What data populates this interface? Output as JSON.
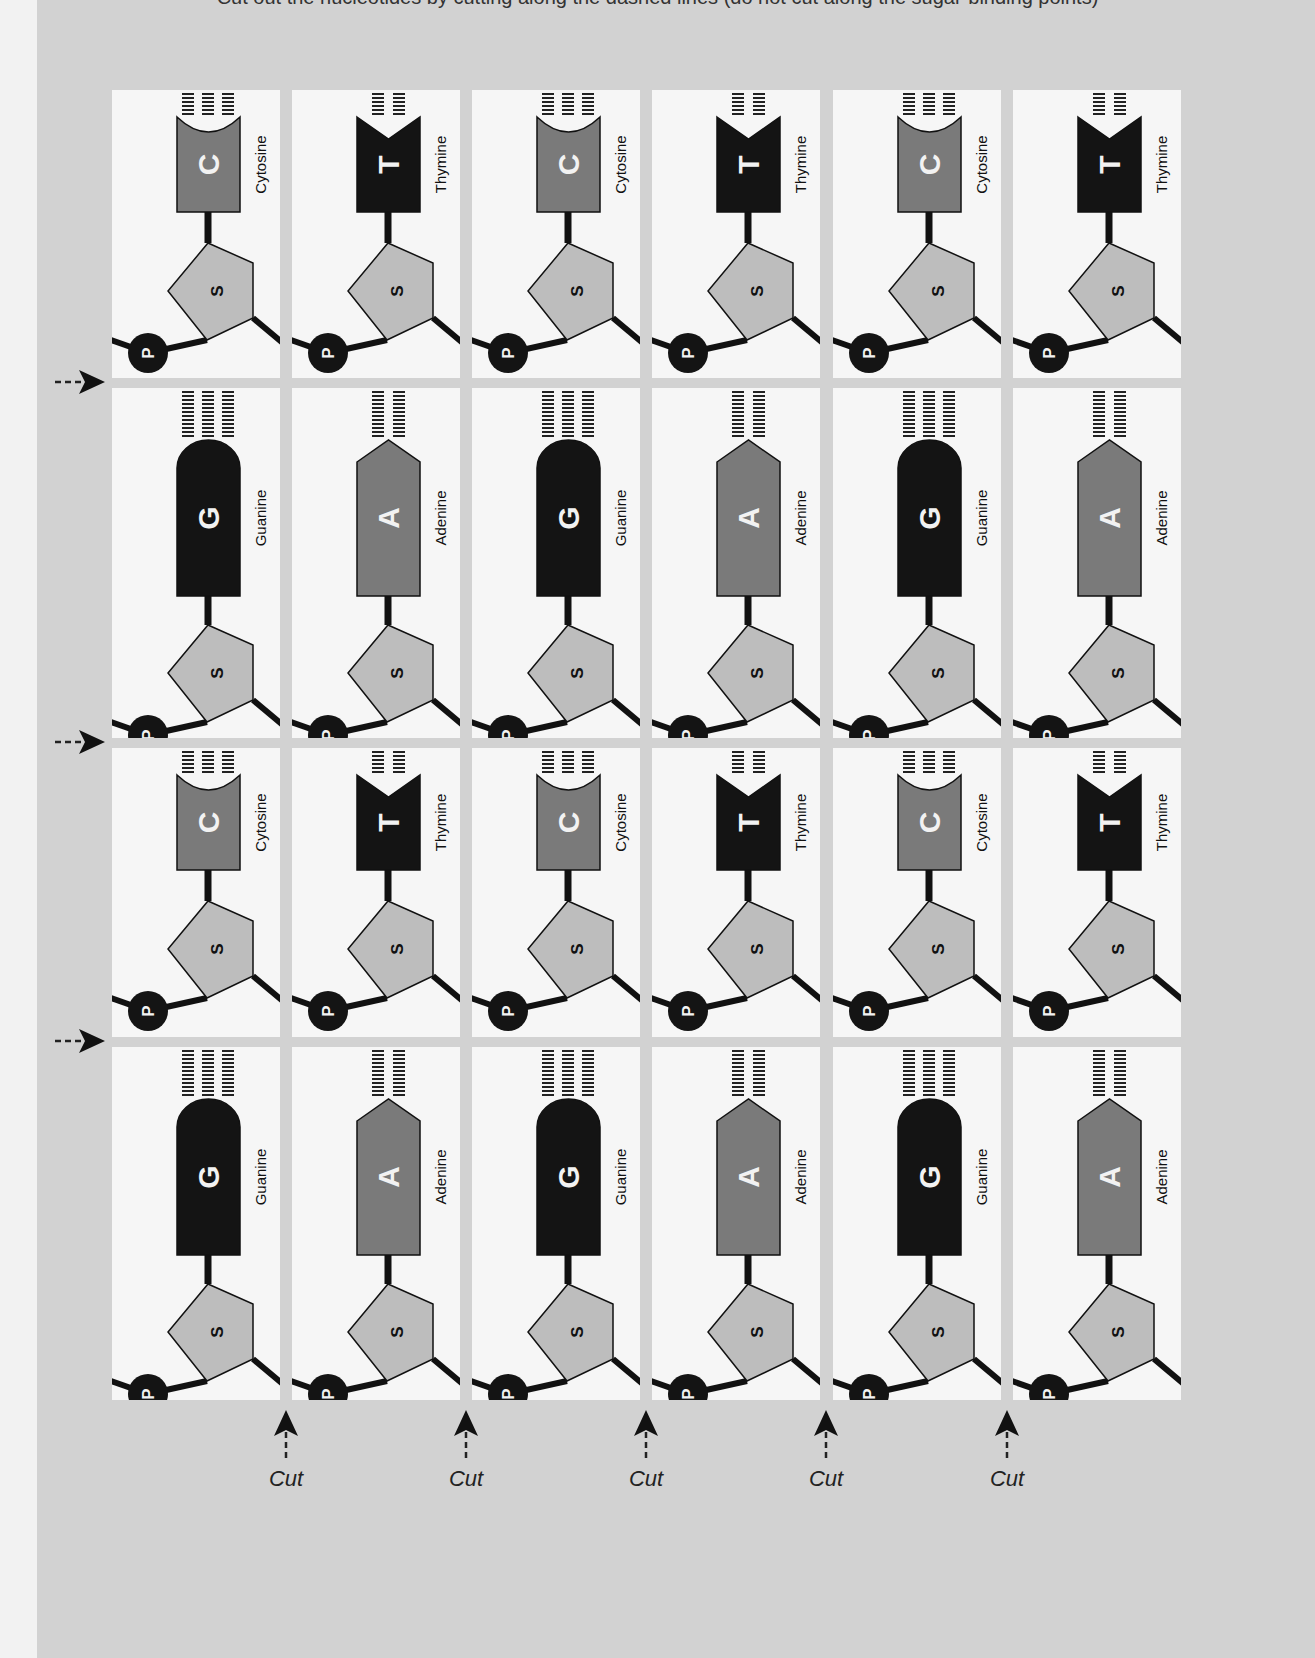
{
  "caption": "Cut out the nucleotides by cutting along the dashed lines (do not cut along the sugar-binding points)",
  "colors": {
    "page_bg": "#d2d2d2",
    "cell_bg": "#f6f6f6",
    "dark_base": "#141414",
    "mid_base": "#7a7a7a",
    "sugar": "#bdbdbd",
    "phosphate": "#141414",
    "outline": "#111111"
  },
  "labels": {
    "phosphate": "P",
    "sugar": "S",
    "cut": "Cut"
  },
  "columns_x": [
    112,
    292,
    472,
    652,
    833,
    1013
  ],
  "column_width": 168,
  "rows": [
    {
      "top": 90,
      "height": 288,
      "type": "pyrimidine",
      "cells": [
        {
          "letter": "C",
          "name": "Cytosine"
        },
        {
          "letter": "T",
          "name": "Thymine"
        },
        {
          "letter": "C",
          "name": "Cytosine"
        },
        {
          "letter": "T",
          "name": "Thymine"
        },
        {
          "letter": "C",
          "name": "Cytosine"
        },
        {
          "letter": "T",
          "name": "Thymine"
        }
      ]
    },
    {
      "top": 388,
      "height": 350,
      "type": "purine",
      "cells": [
        {
          "letter": "G",
          "name": "Guanine"
        },
        {
          "letter": "A",
          "name": "Adenine"
        },
        {
          "letter": "G",
          "name": "Guanine"
        },
        {
          "letter": "A",
          "name": "Adenine"
        },
        {
          "letter": "G",
          "name": "Guanine"
        },
        {
          "letter": "A",
          "name": "Adenine"
        }
      ]
    },
    {
      "top": 748,
      "height": 289,
      "type": "pyrimidine",
      "cells": [
        {
          "letter": "C",
          "name": "Cytosine"
        },
        {
          "letter": "T",
          "name": "Thymine"
        },
        {
          "letter": "C",
          "name": "Cytosine"
        },
        {
          "letter": "T",
          "name": "Thymine"
        },
        {
          "letter": "C",
          "name": "Cytosine"
        },
        {
          "letter": "T",
          "name": "Thymine"
        }
      ]
    },
    {
      "top": 1047,
      "height": 353,
      "type": "purine",
      "cells": [
        {
          "letter": "G",
          "name": "Guanine"
        },
        {
          "letter": "A",
          "name": "Adenine"
        },
        {
          "letter": "G",
          "name": "Guanine"
        },
        {
          "letter": "A",
          "name": "Adenine"
        },
        {
          "letter": "G",
          "name": "Guanine"
        },
        {
          "letter": "A",
          "name": "Adenine"
        }
      ]
    }
  ],
  "row_arrows_y": [
    382,
    742,
    1041
  ],
  "cut_markers_x": [
    286,
    466,
    646,
    826,
    1007
  ],
  "cut_markers_y": 1410
}
